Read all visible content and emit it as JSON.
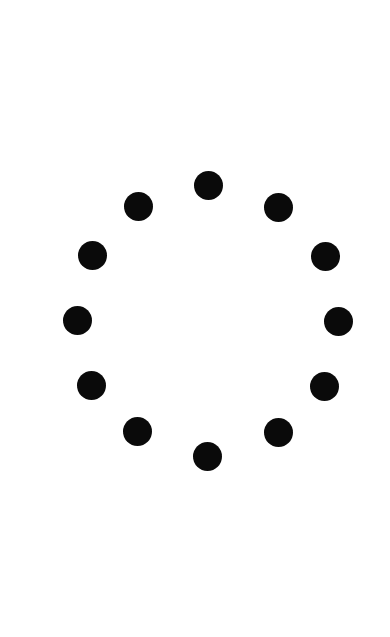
{
  "screen": {
    "background": "#ffffff",
    "state": "loading"
  },
  "spinner": {
    "dot_count": 12,
    "dot_color": "#0a0a0a",
    "dot_diameter": 29,
    "center": [
      208,
      320
    ],
    "dots": [
      {
        "x": 208,
        "y": 185
      },
      {
        "x": 278,
        "y": 207
      },
      {
        "x": 325,
        "y": 256
      },
      {
        "x": 338,
        "y": 321
      },
      {
        "x": 324,
        "y": 386
      },
      {
        "x": 278,
        "y": 432
      },
      {
        "x": 207,
        "y": 456
      },
      {
        "x": 137,
        "y": 431
      },
      {
        "x": 91,
        "y": 385
      },
      {
        "x": 77,
        "y": 320
      },
      {
        "x": 92,
        "y": 255
      },
      {
        "x": 138,
        "y": 206
      }
    ]
  }
}
